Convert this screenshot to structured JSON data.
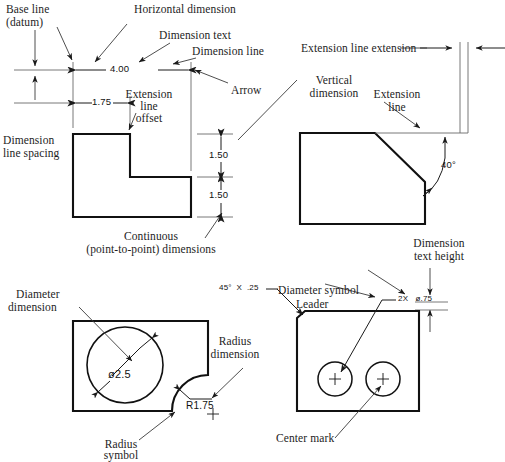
{
  "page": {
    "background": "#ffffff",
    "line_color": "#000000",
    "thin_line_color": "#555555",
    "width": 505,
    "height": 457
  },
  "figures": [
    {
      "id": "fig-top-left",
      "name": "L-shaped part with horizontal and continuous dimensions",
      "callouts": [
        "Base line (datum)",
        "Horizontal dimension",
        "Dimension text",
        "Dimension line",
        "Arrow",
        "Extension line offset",
        "Dimension line spacing",
        "Continuous (point-to-point) dimensions"
      ],
      "dimension_values": [
        "4.00",
        "1.75",
        "1.50",
        "1.50"
      ]
    },
    {
      "id": "fig-top-right",
      "name": "Angled part with vertical dimension and angle",
      "callouts": [
        "Extension line extension",
        "Vertical dimension",
        "Extension line",
        "Dimension text height"
      ],
      "dimension_values": [
        "40°"
      ]
    },
    {
      "id": "fig-bottom-left",
      "name": "Plate with hole and radius notch",
      "callouts": [
        "Diameter dimension",
        "Radius dimension",
        "Radius symbol"
      ],
      "dimension_values": [
        "ø2.5",
        "R1.75"
      ]
    },
    {
      "id": "fig-bottom-right",
      "name": "Plate with two holes, leader and center marks",
      "callouts": [
        "Diameter symbol",
        "Leader",
        "Center mark"
      ],
      "dimension_values": [
        "45° X .25",
        "2X  ø.75"
      ]
    }
  ],
  "labels": {
    "base_line_1": "Base line",
    "base_line_2": "(datum)",
    "horizontal_dimension": "Horizontal dimension",
    "dimension_text": "Dimension text",
    "dimension_line": "Dimension line",
    "arrow": "Arrow",
    "extension_line_offset_1": "Extension",
    "extension_line_offset_2": "line",
    "extension_line_offset_3": "offset",
    "dimension_line_spacing_1": "Dimension",
    "dimension_line_spacing_2": "line spacing",
    "continuous_1": "Continuous",
    "continuous_2": "(point-to-point) dimensions",
    "extension_line_extension": "Extension line extension",
    "vertical_dimension_1": "Vertical",
    "vertical_dimension_2": "dimension",
    "extension_line_1": "Extension",
    "extension_line_2": "line",
    "dimension_text_height_1": "Dimension",
    "dimension_text_height_2": "text height",
    "diameter_dimension_1": "Diameter",
    "diameter_dimension_2": "dimension",
    "radius_dimension_1": "Radius",
    "radius_dimension_2": "dimension",
    "radius_symbol_1": "Radius",
    "radius_symbol_2": "symbol",
    "diameter_symbol": "Diameter symbol",
    "leader": "Leader",
    "center_mark": "Center mark"
  },
  "dimensions": {
    "d_4_00": "4.00",
    "d_1_75": "1.75",
    "d_1_50_upper": "1.50",
    "d_1_50_lower": "1.50",
    "d_angle_40": "40°",
    "d_dia_2_5": "ø2.5",
    "d_r_1_75": "R1.75",
    "d_chamfer": "45°  X  .25",
    "d_2x_dia": "2X   ø.75"
  }
}
